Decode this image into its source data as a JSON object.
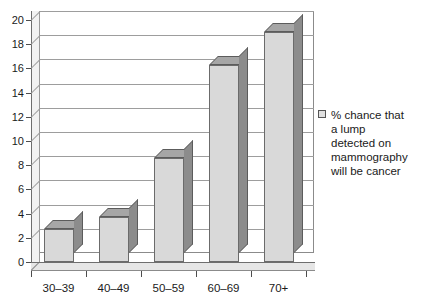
{
  "chart_data": {
    "type": "bar",
    "title": "",
    "subtitle": "",
    "xlabel": "",
    "ylabel": "",
    "categories": [
      "30–39",
      "40–49",
      "50–59",
      "60–69",
      "70+"
    ],
    "values": [
      2.7,
      3.7,
      8.6,
      16.3,
      19.0
    ],
    "series": [
      {
        "name": "% chance that a lump detected on mammography will be cancer",
        "values": [
          2.7,
          3.7,
          8.6,
          16.3,
          19.0
        ]
      }
    ],
    "ylim": [
      0,
      20
    ],
    "ytick_step": 2,
    "ytick_labels": [
      "0",
      "2",
      "4",
      "6",
      "8",
      "10",
      "12",
      "14",
      "16",
      "18",
      "20"
    ],
    "grid": "horizontal",
    "legend_position": "right",
    "style": "3d-column",
    "colors": {
      "bar_front": "#d9d9d9",
      "bar_side": "#8c8c8c",
      "bar_top": "#a6a6a6",
      "bar_edge": "#6b6b6b",
      "gridline": "#9d9d9d",
      "axis": "#6e6e6e",
      "background": "#ffffff",
      "text": "#1a1a1a"
    }
  },
  "legend": {
    "marker_name": "legend-swatch",
    "entries": [
      {
        "label_lines": [
          "% chance that",
          "a lump",
          "detected on",
          "mammography",
          "will be cancer"
        ],
        "label": "% chance that a lump detected on mammography will be cancer"
      }
    ]
  }
}
